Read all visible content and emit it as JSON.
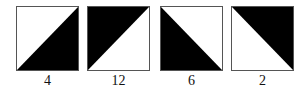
{
  "tiles": [
    {
      "label": "4",
      "shaded": "bottom-right",
      "diagonal": "bottom-left-to-top-right"
    },
    {
      "label": "12",
      "shaded": "top-left",
      "diagonal": "bottom-left-to-top-right"
    },
    {
      "label": "6",
      "shaded": "bottom-left",
      "diagonal": "top-left-to-bottom-right"
    },
    {
      "label": "2",
      "shaded": "top-right",
      "diagonal": "top-left-to-bottom-right"
    }
  ],
  "colors": {
    "fill": "#000000",
    "background": "#ffffff",
    "border": "#555555"
  }
}
